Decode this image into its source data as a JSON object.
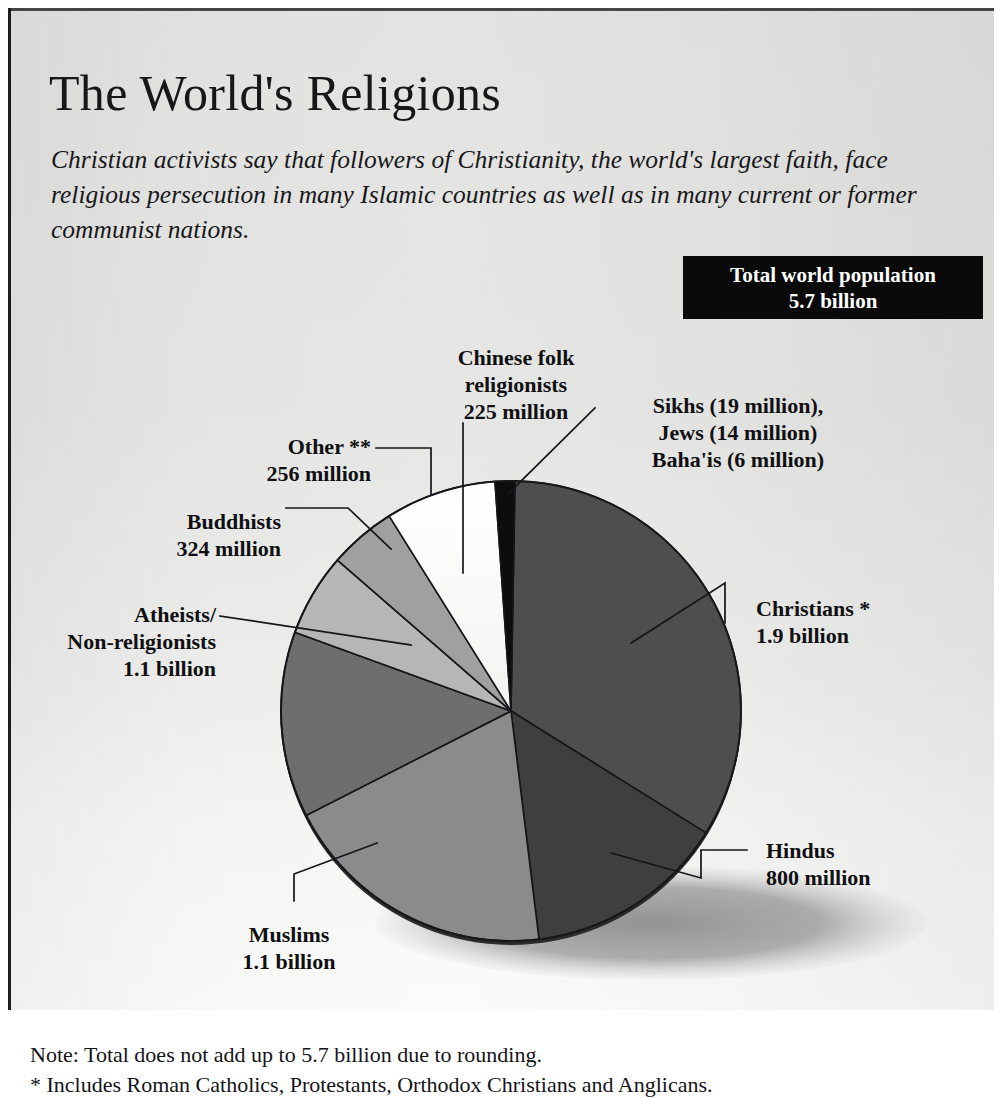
{
  "header": {
    "title": "The World's Religions",
    "deck": "Christian activists say that followers of Christianity, the world's largest faith, face religious persecution in many Islamic countries as well as in many current or former communist nations."
  },
  "total_box": {
    "line1": "Total world population",
    "line2": "5.7 billion"
  },
  "labels": {
    "chinese": "Chinese folk\nreligionists\n225 million",
    "sikhs": "Sikhs (19 million),\nJews (14 million)\nBaha'is (6 million)",
    "other": "Other **\n256 million",
    "buddhists": "Buddhists\n324 million",
    "atheists": "Atheists/\nNon-religionists\n1.1 billion",
    "muslims": "Muslims\n1.1 billion",
    "christians": "Christians *\n1.9 billion",
    "hindus": "Hindus\n800 million"
  },
  "notes": {
    "line1": "Note: Total does not add up to 5.7 billion due to rounding.",
    "line2": "* Includes Roman Catholics, Protestants, Orthodox Christians and Anglicans."
  },
  "chart_data": {
    "type": "pie",
    "title": "The World's Religions",
    "unit": "people",
    "total_label": "5.7 billion",
    "legend": "callout-labels",
    "grid": false,
    "categories": [
      "Christians",
      "Hindus",
      "Muslims",
      "Atheists/Non-religionists",
      "Buddhists",
      "Other",
      "Chinese folk religionists",
      "Sikhs, Jews, Baha'is"
    ],
    "values": [
      1900,
      800,
      1100,
      1100,
      324,
      256,
      225,
      39
    ],
    "value_labels": [
      "1.9 billion",
      "800 million",
      "1.1 billion",
      "1.1 billion",
      "324 million",
      "256 million",
      "225 million",
      "19 million / 14 million / 6 million"
    ],
    "colors": [
      "#4e4e4e",
      "#3f3f3f",
      "#8b8b8b",
      "#6e6e6e",
      "#b6b6b6",
      "#a0a0a0",
      "#fbfbfa",
      "#0d0d0d"
    ],
    "slices": [
      {
        "name": "Christians",
        "value": 1900,
        "start_deg": 1,
        "end_deg": 122
      },
      {
        "name": "Hindus",
        "value": 800,
        "start_deg": 122,
        "end_deg": 173
      },
      {
        "name": "Muslims",
        "value": 1100,
        "start_deg": 173,
        "end_deg": 243
      },
      {
        "name": "Atheists/Non-religionists",
        "value": 1100,
        "start_deg": 243,
        "end_deg": 290
      },
      {
        "name": "Buddhists",
        "value": 324,
        "start_deg": 290,
        "end_deg": 311
      },
      {
        "name": "Other",
        "value": 256,
        "start_deg": 311,
        "end_deg": 328
      },
      {
        "name": "Chinese folk religionists",
        "value": 225,
        "start_deg": 328,
        "end_deg": 356
      },
      {
        "name": "Sikhs, Jews, Baha'is",
        "value": 39,
        "start_deg": 356,
        "end_deg": 361
      }
    ]
  }
}
